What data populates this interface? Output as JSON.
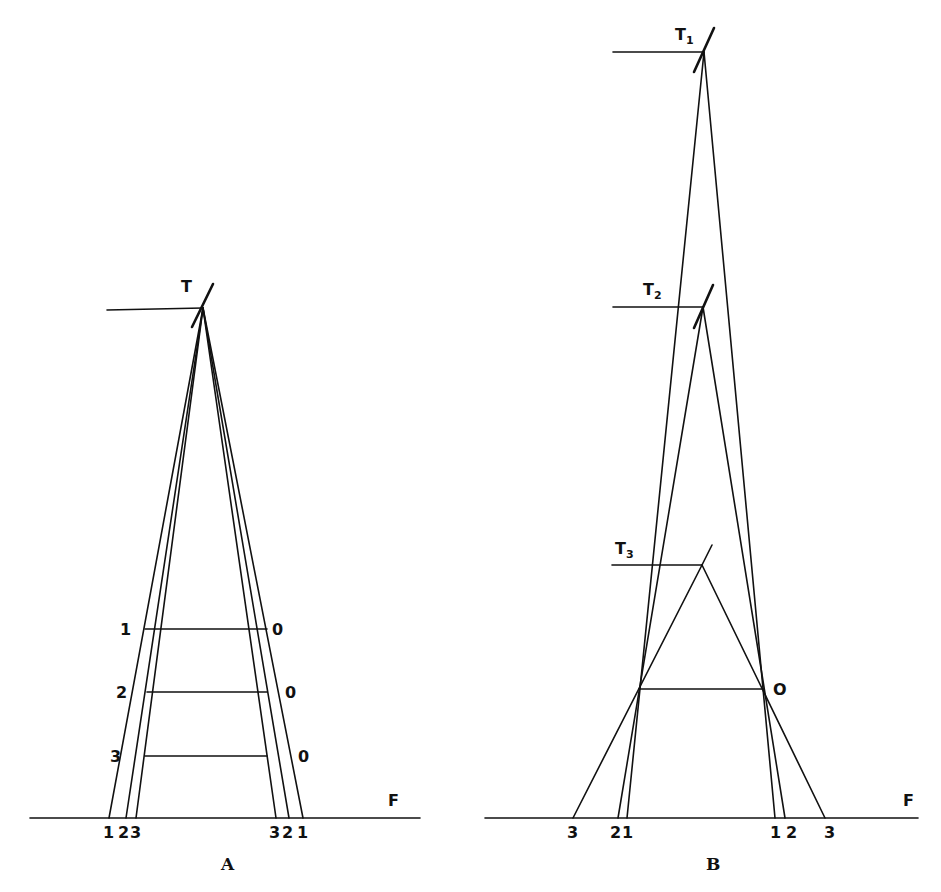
{
  "figure_a": {
    "caption": "A",
    "apex_label": "T",
    "floor_label": "F",
    "left_labels": [
      "1",
      "2",
      "3"
    ],
    "right_labels": [
      "0",
      "0",
      "0"
    ],
    "base_left_labels": [
      "1",
      "2",
      "3"
    ],
    "base_right_labels": [
      "3",
      "2",
      "1"
    ]
  },
  "figure_b": {
    "caption": "B",
    "apex_labels": [
      {
        "main": "T",
        "sub": "1"
      },
      {
        "main": "T",
        "sub": "2"
      },
      {
        "main": "T",
        "sub": "3"
      }
    ],
    "floor_label": "F",
    "crossbar_label": "O",
    "base_left_labels": [
      "3",
      "2",
      "1"
    ],
    "base_right_labels": [
      "1",
      "2",
      "3"
    ]
  },
  "colors": {
    "line": "#111111",
    "background": "#ffffff"
  }
}
